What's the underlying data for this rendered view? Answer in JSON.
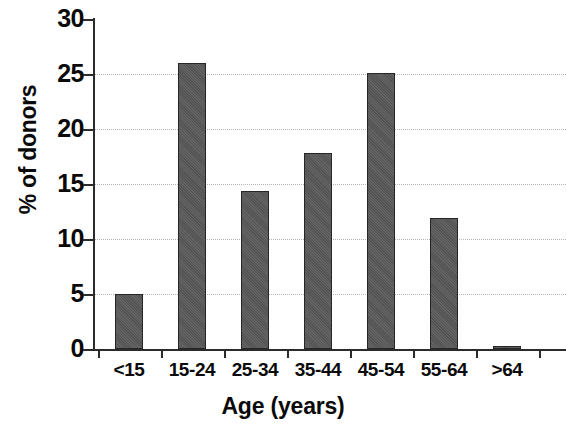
{
  "chart_data": {
    "type": "bar",
    "title": "",
    "subtitle": "",
    "xlabel": "Age (years)",
    "ylabel": "% of donors",
    "categories": [
      "<15",
      "15-24",
      "25-34",
      "35-44",
      "45-54",
      "55-64",
      ">64"
    ],
    "values": [
      5.0,
      26.0,
      14.4,
      17.8,
      25.1,
      11.9,
      0.3
    ],
    "series": [
      {
        "name": "% of donors",
        "values": [
          5.0,
          26.0,
          14.4,
          17.8,
          25.1,
          11.9,
          0.3
        ]
      }
    ],
    "ylim": [
      0,
      30
    ],
    "ytick_labels": [
      "0",
      "5",
      "10",
      "15",
      "20",
      "25",
      "30"
    ],
    "ytick_values": [
      0,
      5,
      10,
      15,
      20,
      25,
      30
    ],
    "grid": "horizontal-dotted",
    "legend": "none",
    "bar_color": "#585858",
    "bar_border_color": "#262626",
    "axis_color": "#2b2b2b",
    "gridline_color": "#b5b5b5",
    "text_color": "#0a0a0a",
    "background_color": "#ffffff"
  }
}
